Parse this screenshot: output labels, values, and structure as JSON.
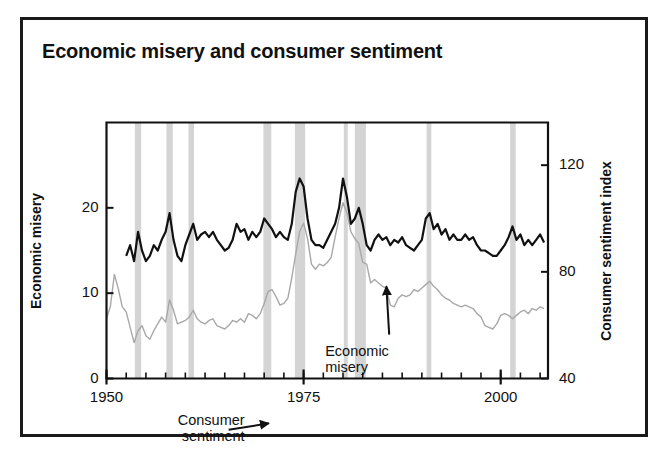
{
  "figure": {
    "title": "Economic misery and consumer sentiment",
    "background_color": "#ffffff",
    "frame_color": "#1a1a1a"
  },
  "chart_data": {
    "type": "line",
    "title": "Economic misery and consumer sentiment",
    "xlabel": "",
    "ylabel": "Economic misery",
    "y2label": "Consumer sentiment index",
    "xlim": [
      1950,
      2006
    ],
    "ylim": [
      0,
      30
    ],
    "y2lim": [
      136,
      40
    ],
    "y2_inverted": true,
    "grid": false,
    "legend_position": "inline-annotations",
    "xticks": [
      1950,
      1975,
      2000
    ],
    "xtick_labels": [
      "1950",
      "1975",
      "2000"
    ],
    "xminor_tick_interval": 2.5,
    "yticks": [
      0,
      10,
      20
    ],
    "ytick_labels": [
      "0",
      "10",
      "20"
    ],
    "y2ticks": [
      40,
      80,
      120
    ],
    "y2tick_labels": [
      "40",
      "80",
      "120"
    ],
    "annotations": [
      {
        "text": "Consumer\nsentiment",
        "x": 1966.0,
        "y": 27.5,
        "arrow_to_x": 1970.6,
        "arrow_to_y": 23.2
      },
      {
        "text": "Economic\nmisery",
        "x": 1978.5,
        "y": 4.2,
        "arrow_to_x": 1985.5,
        "arrow_to_y": 10.8
      }
    ],
    "recession_bands": [
      {
        "start": 1953.6,
        "end": 1954.4
      },
      {
        "start": 1957.6,
        "end": 1958.4
      },
      {
        "start": 1960.4,
        "end": 1961.1
      },
      {
        "start": 1969.9,
        "end": 1970.9
      },
      {
        "start": 1973.9,
        "end": 1975.2
      },
      {
        "start": 1980.1,
        "end": 1980.6
      },
      {
        "start": 1981.5,
        "end": 1982.9
      },
      {
        "start": 1990.6,
        "end": 1991.2
      },
      {
        "start": 2001.2,
        "end": 2001.9
      }
    ],
    "series": [
      {
        "name": "Consumer sentiment",
        "axis": "right",
        "color": "#111111",
        "line_width": 2.2,
        "note": "Plotted on inverted right axis: higher drawn position = lower sentiment index.",
        "x": [
          1952.5,
          1953.0,
          1953.5,
          1954.0,
          1954.5,
          1955.0,
          1955.5,
          1956.0,
          1956.5,
          1957.0,
          1957.5,
          1958.0,
          1958.5,
          1959.0,
          1959.5,
          1960.0,
          1960.5,
          1961.0,
          1961.5,
          1962.0,
          1962.5,
          1963.0,
          1963.5,
          1964.0,
          1964.5,
          1965.0,
          1965.5,
          1966.0,
          1966.5,
          1967.0,
          1967.5,
          1968.0,
          1968.5,
          1969.0,
          1969.5,
          1970.0,
          1970.5,
          1971.0,
          1971.5,
          1972.0,
          1972.5,
          1973.0,
          1973.5,
          1974.0,
          1974.5,
          1975.0,
          1975.5,
          1976.0,
          1976.5,
          1977.0,
          1977.5,
          1978.0,
          1978.5,
          1979.0,
          1979.5,
          1980.0,
          1980.5,
          1981.0,
          1981.5,
          1982.0,
          1982.5,
          1983.0,
          1983.5,
          1984.0,
          1984.5,
          1985.0,
          1985.5,
          1986.0,
          1986.5,
          1987.0,
          1987.5,
          1988.0,
          1988.5,
          1989.0,
          1989.5,
          1990.0,
          1990.5,
          1991.0,
          1991.5,
          1992.0,
          1992.5,
          1993.0,
          1993.5,
          1994.0,
          1994.5,
          1995.0,
          1995.5,
          1996.0,
          1996.5,
          1997.0,
          1997.5,
          1998.0,
          1998.5,
          1999.0,
          1999.5,
          2000.0,
          2000.5,
          2001.0,
          2001.5,
          2002.0,
          2002.5,
          2003.0,
          2003.5,
          2004.0,
          2004.5,
          2005.0,
          2005.5
        ],
        "y": [
          86,
          90,
          84,
          95,
          88,
          84,
          86,
          90,
          88,
          92,
          95,
          102,
          92,
          86,
          84,
          90,
          94,
          98,
          92,
          94,
          95,
          93,
          95,
          92,
          90,
          88,
          89,
          92,
          98,
          95,
          96,
          92,
          95,
          93,
          95,
          100,
          98,
          96,
          93,
          95,
          93,
          92,
          98,
          110,
          115,
          112,
          100,
          92,
          90,
          90,
          89,
          92,
          95,
          98,
          104,
          115,
          108,
          98,
          100,
          104,
          98,
          90,
          88,
          92,
          94,
          92,
          93,
          90,
          92,
          91,
          93,
          90,
          89,
          88,
          90,
          92,
          100,
          102,
          96,
          98,
          94,
          96,
          92,
          94,
          92,
          92,
          94,
          92,
          93,
          90,
          88,
          88,
          87,
          86,
          86,
          88,
          90,
          93,
          97,
          92,
          94,
          90,
          92,
          90,
          92,
          94,
          91
        ]
      },
      {
        "name": "Economic misery",
        "axis": "left",
        "color": "#a8a8a8",
        "line_width": 1.4,
        "note": "Misery index = unemployment rate + inflation rate.",
        "x": [
          1950.0,
          1950.5,
          1951.0,
          1951.5,
          1952.0,
          1952.5,
          1953.0,
          1953.5,
          1954.0,
          1954.5,
          1955.0,
          1955.5,
          1956.0,
          1956.5,
          1957.0,
          1957.5,
          1958.0,
          1958.5,
          1959.0,
          1959.5,
          1960.0,
          1960.5,
          1961.0,
          1961.5,
          1962.0,
          1962.5,
          1963.0,
          1963.5,
          1964.0,
          1964.5,
          1965.0,
          1965.5,
          1966.0,
          1966.5,
          1967.0,
          1967.5,
          1968.0,
          1968.5,
          1969.0,
          1969.5,
          1970.0,
          1970.5,
          1971.0,
          1971.5,
          1972.0,
          1972.5,
          1973.0,
          1973.5,
          1974.0,
          1974.5,
          1975.0,
          1975.5,
          1976.0,
          1976.5,
          1977.0,
          1977.5,
          1978.0,
          1978.5,
          1979.0,
          1979.5,
          1980.0,
          1980.5,
          1981.0,
          1981.5,
          1982.0,
          1982.5,
          1983.0,
          1983.5,
          1984.0,
          1984.5,
          1985.0,
          1985.5,
          1986.0,
          1986.5,
          1987.0,
          1987.5,
          1988.0,
          1988.5,
          1989.0,
          1989.5,
          1990.0,
          1990.5,
          1991.0,
          1991.5,
          1992.0,
          1992.5,
          1993.0,
          1993.5,
          1994.0,
          1994.5,
          1995.0,
          1995.5,
          1996.0,
          1996.5,
          1997.0,
          1997.5,
          1998.0,
          1998.5,
          1999.0,
          1999.5,
          2000.0,
          2000.5,
          2001.0,
          2001.5,
          2002.0,
          2002.5,
          2003.0,
          2003.5,
          2004.0,
          2004.5,
          2005.0,
          2005.5
        ],
        "y": [
          7.0,
          8.5,
          12.2,
          10.5,
          8.4,
          7.8,
          6.0,
          4.2,
          5.6,
          6.2,
          5.0,
          4.6,
          5.6,
          6.4,
          7.2,
          6.6,
          9.2,
          8.0,
          6.4,
          6.6,
          6.8,
          7.2,
          8.0,
          7.0,
          6.6,
          6.4,
          6.8,
          7.0,
          6.2,
          6.0,
          5.8,
          6.2,
          6.8,
          6.6,
          7.0,
          6.6,
          7.6,
          7.4,
          7.0,
          7.6,
          8.8,
          10.2,
          10.4,
          9.6,
          8.6,
          8.8,
          9.4,
          11.8,
          14.6,
          17.2,
          18.2,
          16.4,
          13.4,
          12.8,
          13.4,
          13.2,
          13.6,
          14.2,
          16.6,
          18.8,
          20.6,
          19.4,
          17.2,
          16.4,
          15.8,
          13.6,
          13.4,
          11.2,
          11.6,
          11.2,
          10.8,
          10.6,
          8.6,
          8.4,
          9.4,
          9.8,
          9.6,
          9.8,
          10.4,
          10.2,
          10.6,
          11.0,
          11.4,
          10.8,
          10.4,
          9.8,
          9.4,
          9.2,
          8.8,
          8.6,
          8.4,
          8.6,
          8.4,
          8.2,
          7.6,
          7.2,
          6.2,
          6.0,
          5.8,
          6.4,
          7.4,
          7.6,
          7.4,
          7.0,
          7.4,
          7.8,
          8.0,
          7.6,
          8.2,
          8.0,
          8.4,
          8.2
        ]
      }
    ]
  }
}
